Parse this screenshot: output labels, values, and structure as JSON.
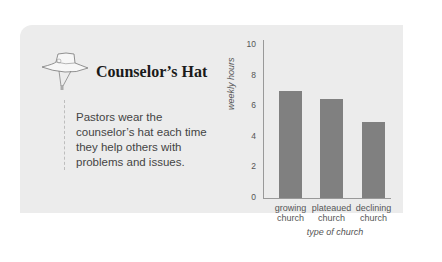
{
  "card": {
    "title": "Counselor’s Hat",
    "description": "Pastors wear the counselor’s hat each time they help others with problems and issues.",
    "icon": "bucket-hat-icon"
  },
  "chart_data": {
    "type": "bar",
    "categories": [
      "growing church",
      "plateaued church",
      "declining church"
    ],
    "category_lines": [
      [
        "growing",
        "church"
      ],
      [
        "plateaued",
        "church"
      ],
      [
        "declining",
        "church"
      ]
    ],
    "values": [
      7.0,
      6.5,
      5.0
    ],
    "title": "",
    "xlabel": "type of church",
    "ylabel": "weekly hours",
    "ylim": [
      0,
      10
    ],
    "yticks": [
      "0",
      "2",
      "4",
      "6",
      "8",
      "10"
    ],
    "grid": false,
    "bar_color": "#808080"
  }
}
